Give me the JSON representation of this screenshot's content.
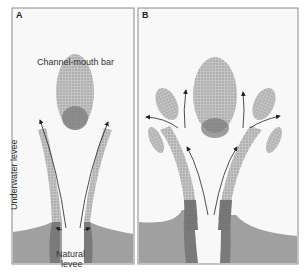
{
  "panels": [
    {
      "label": "A",
      "annotations": {
        "bar": "Channel-mouth bar",
        "underwater": "Underwater levee",
        "natural_line1": "Natural",
        "natural_line2": "levee"
      }
    },
    {
      "label": "B"
    }
  ],
  "colors": {
    "water": "#f8f8f8",
    "land": "#9c9c9c",
    "stipple": "#b8b8b8",
    "dark_stipple": "#555555",
    "border": "#8a8a8a"
  }
}
